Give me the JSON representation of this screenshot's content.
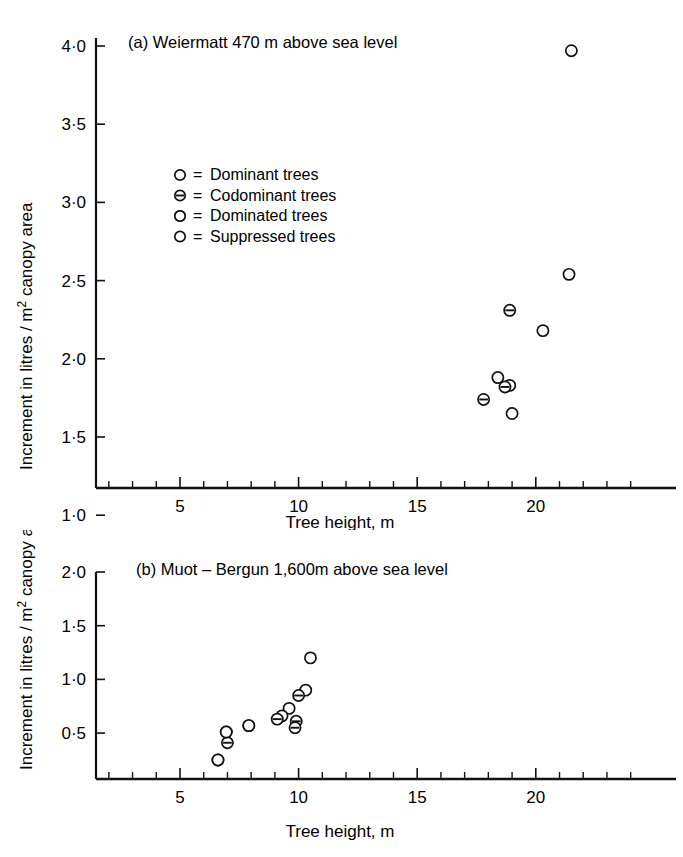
{
  "figure": {
    "background_color": "#ffffff",
    "ink_color": "#111111"
  },
  "legend": {
    "items": [
      {
        "symbol": "open-circle",
        "equals": "=",
        "label": "Dominant trees"
      },
      {
        "symbol": "circle-with-bar",
        "equals": "=",
        "label": "Codominant trees"
      },
      {
        "symbol": "half-filled-circle",
        "equals": "=",
        "label": "Dominated trees"
      },
      {
        "symbol": "filled-circle",
        "equals": "=",
        "label": "Suppressed trees"
      }
    ]
  },
  "chart_data": [
    {
      "type": "scatter",
      "panel": "a",
      "title": "(a)  Weiermatt 470 m above sea level",
      "xlabel": "Tree height, m",
      "ylabel": "Increment in litres / m² canopy area",
      "xlim": [
        0,
        24.5
      ],
      "ylim": [
        0,
        4.25
      ],
      "xticks": [
        5,
        10,
        15,
        20
      ],
      "xticklabels": [
        "5",
        "10",
        "15",
        "20"
      ],
      "xminor_step": 1,
      "yticks": [
        0.5,
        1.0,
        1.5,
        2.0,
        2.5,
        3.0,
        3.5,
        4.0
      ],
      "yticklabels": [
        "0·5",
        "1·0",
        "1·5",
        "2·0",
        "2·5",
        "3·0",
        "3·5",
        "4·0"
      ],
      "grid": false,
      "legend_position": "upper-left-inside",
      "series": [
        {
          "name": "Dominant trees",
          "marker": "open-circle",
          "points": [
            {
              "x": 21.5,
              "y": 3.97
            },
            {
              "x": 21.4,
              "y": 2.54
            },
            {
              "x": 20.3,
              "y": 2.18
            },
            {
              "x": 18.4,
              "y": 1.88
            },
            {
              "x": 18.9,
              "y": 1.83
            },
            {
              "x": 19.0,
              "y": 1.65
            },
            {
              "x": 14.3,
              "y": 0.46
            }
          ]
        },
        {
          "name": "Codominant trees",
          "marker": "circle-with-bar",
          "points": [
            {
              "x": 18.9,
              "y": 2.31
            },
            {
              "x": 18.7,
              "y": 1.82
            },
            {
              "x": 17.8,
              "y": 1.74
            },
            {
              "x": 17.2,
              "y": 0.59
            }
          ]
        },
        {
          "name": "Dominated trees",
          "marker": "half-filled-circle",
          "points": [
            {
              "x": 16.6,
              "y": 0.78
            },
            {
              "x": 16.9,
              "y": 0.6
            }
          ]
        },
        {
          "name": "Suppressed trees",
          "marker": "filled-circle",
          "points": [
            {
              "x": 17.2,
              "y": 0.58
            }
          ]
        }
      ]
    },
    {
      "type": "scatter",
      "panel": "b",
      "title": "(b)  Muot – Bergun 1,600m above sea level",
      "xlabel": "Tree height, m",
      "ylabel": "Increment in litres / m² canopy area",
      "xlim": [
        0,
        24.5
      ],
      "ylim": [
        0,
        2.2
      ],
      "xticks": [
        5,
        10,
        15,
        20
      ],
      "xticklabels": [
        "5",
        "10",
        "15",
        "20"
      ],
      "xminor_step": 1,
      "yticks": [
        0.5,
        1.0,
        1.5,
        2.0
      ],
      "yticklabels": [
        "0·5",
        "1·0",
        "1·5",
        "2·0"
      ],
      "grid": false,
      "legend_position": "none",
      "series": [
        {
          "name": "Dominant trees",
          "marker": "open-circle",
          "points": [
            {
              "x": 10.5,
              "y": 1.2
            },
            {
              "x": 10.3,
              "y": 0.9
            },
            {
              "x": 9.6,
              "y": 0.73
            },
            {
              "x": 9.3,
              "y": 0.66
            }
          ]
        },
        {
          "name": "Codominant trees",
          "marker": "circle-with-bar",
          "points": [
            {
              "x": 10.0,
              "y": 0.85
            },
            {
              "x": 9.1,
              "y": 0.63
            },
            {
              "x": 9.9,
              "y": 0.61
            },
            {
              "x": 9.85,
              "y": 0.55
            },
            {
              "x": 7.0,
              "y": 0.41
            }
          ]
        },
        {
          "name": "Dominated trees",
          "marker": "half-filled-circle",
          "points": [
            {
              "x": 7.9,
              "y": 0.57
            },
            {
              "x": 6.95,
              "y": 0.51
            },
            {
              "x": 6.6,
              "y": 0.25
            }
          ]
        },
        {
          "name": "Suppressed trees",
          "marker": "filled-circle",
          "points": []
        }
      ]
    }
  ]
}
